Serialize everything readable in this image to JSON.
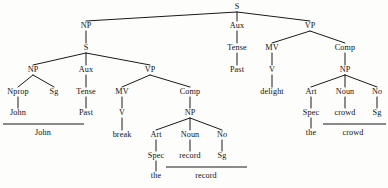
{
  "diagram": {
    "sentence": "John Past break the record Past delight the crowd",
    "width": 388,
    "height": 188,
    "background_color": "#fdfdfc",
    "ink_color": "#1a1a1a"
  },
  "nodes": [
    {
      "id": "s-root",
      "label": "S",
      "kind": "cat",
      "x": 237,
      "y": 7
    },
    {
      "id": "np-subj",
      "label": "NP",
      "kind": "cat",
      "x": 86,
      "y": 26
    },
    {
      "id": "aux-main",
      "label": "Aux",
      "kind": "cat",
      "x": 237,
      "y": 26
    },
    {
      "id": "vp-main",
      "label": "VP",
      "kind": "cat",
      "x": 310,
      "y": 26
    },
    {
      "id": "s-embedded",
      "label": "S",
      "kind": "cat",
      "x": 86,
      "y": 48
    },
    {
      "id": "tense-main",
      "label": "Tense",
      "kind": "cat",
      "x": 237,
      "y": 48
    },
    {
      "id": "mv-main",
      "label": "MV",
      "kind": "cat",
      "x": 272,
      "y": 48
    },
    {
      "id": "comp-main",
      "label": "Comp",
      "kind": "cat",
      "x": 345,
      "y": 48
    },
    {
      "id": "np-emb",
      "label": "NP",
      "kind": "cat",
      "x": 33,
      "y": 70
    },
    {
      "id": "aux-emb",
      "label": "Aux",
      "kind": "cat",
      "x": 86,
      "y": 70
    },
    {
      "id": "vp-emb",
      "label": "VP",
      "kind": "cat",
      "x": 150,
      "y": 70
    },
    {
      "id": "past-main",
      "label": "Past",
      "kind": "terminal",
      "x": 237,
      "y": 70
    },
    {
      "id": "v-main",
      "label": "V",
      "kind": "cat",
      "x": 272,
      "y": 70
    },
    {
      "id": "np-obj-main",
      "label": "NP",
      "kind": "cat",
      "x": 345,
      "y": 70
    },
    {
      "id": "nprop",
      "label": "Nprop",
      "kind": "cat",
      "x": 18,
      "y": 92
    },
    {
      "id": "sg-subj",
      "label": "Sg",
      "kind": "cat",
      "x": 54,
      "y": 92
    },
    {
      "id": "tense-emb",
      "label": "Tense",
      "kind": "cat",
      "x": 86,
      "y": 92
    },
    {
      "id": "mv-emb",
      "label": "MV",
      "kind": "cat",
      "x": 122,
      "y": 92
    },
    {
      "id": "comp-emb",
      "label": "Comp",
      "kind": "cat",
      "x": 190,
      "y": 92
    },
    {
      "id": "delight",
      "label": "delight",
      "kind": "terminal",
      "x": 272,
      "y": 92
    },
    {
      "id": "art-main",
      "label": "Art",
      "kind": "cat",
      "x": 311,
      "y": 92
    },
    {
      "id": "noun-main",
      "label": "Noun",
      "kind": "cat",
      "x": 345,
      "y": 92
    },
    {
      "id": "no-main",
      "label": "No",
      "kind": "cat",
      "x": 377,
      "y": 92,
      "italic_tail": 1
    },
    {
      "id": "john-term",
      "label": "John",
      "kind": "terminal",
      "x": 18,
      "y": 113
    },
    {
      "id": "past-emb",
      "label": "Past",
      "kind": "terminal",
      "x": 86,
      "y": 113
    },
    {
      "id": "v-emb",
      "label": "V",
      "kind": "cat",
      "x": 122,
      "y": 113
    },
    {
      "id": "np-obj-emb",
      "label": "NP",
      "kind": "cat",
      "x": 190,
      "y": 113
    },
    {
      "id": "spec-main",
      "label": "Spec",
      "kind": "cat",
      "x": 311,
      "y": 113
    },
    {
      "id": "crowd-term",
      "label": "crowd",
      "kind": "terminal",
      "x": 345,
      "y": 113
    },
    {
      "id": "sg-main",
      "label": "Sg",
      "kind": "cat",
      "x": 377,
      "y": 113
    },
    {
      "id": "break-term",
      "label": "break",
      "kind": "terminal",
      "x": 122,
      "y": 135
    },
    {
      "id": "art-emb",
      "label": "Art",
      "kind": "cat",
      "x": 156,
      "y": 135
    },
    {
      "id": "noun-emb",
      "label": "Noun",
      "kind": "cat",
      "x": 190,
      "y": 135
    },
    {
      "id": "no-emb",
      "label": "No",
      "kind": "cat",
      "x": 222,
      "y": 135,
      "italic_tail": 1
    },
    {
      "id": "the-main",
      "label": "the",
      "kind": "terminal",
      "x": 311,
      "y": 133
    },
    {
      "id": "spec-emb",
      "label": "Spec",
      "kind": "cat",
      "x": 156,
      "y": 156
    },
    {
      "id": "record-term",
      "label": "record",
      "kind": "terminal",
      "x": 190,
      "y": 156
    },
    {
      "id": "sg-emb",
      "label": "Sg",
      "kind": "cat",
      "x": 222,
      "y": 156
    },
    {
      "id": "the-emb",
      "label": "the",
      "kind": "terminal",
      "x": 156,
      "y": 176
    },
    {
      "id": "phrase-john",
      "label": "John",
      "kind": "phrase",
      "x": 43,
      "y": 133
    },
    {
      "id": "phrase-crowd",
      "label": "crowd",
      "kind": "phrase",
      "x": 353,
      "y": 133
    },
    {
      "id": "phrase-record",
      "label": "record",
      "kind": "phrase",
      "x": 206,
      "y": 176
    }
  ],
  "edges": [
    {
      "from": "s-root",
      "to": "np-subj"
    },
    {
      "from": "s-root",
      "to": "aux-main"
    },
    {
      "from": "s-root",
      "to": "vp-main"
    },
    {
      "from": "np-subj",
      "to": "s-embedded"
    },
    {
      "from": "aux-main",
      "to": "tense-main"
    },
    {
      "from": "vp-main",
      "to": "mv-main"
    },
    {
      "from": "vp-main",
      "to": "comp-main"
    },
    {
      "from": "s-embedded",
      "to": "np-emb"
    },
    {
      "from": "s-embedded",
      "to": "aux-emb"
    },
    {
      "from": "s-embedded",
      "to": "vp-emb"
    },
    {
      "from": "tense-main",
      "to": "past-main"
    },
    {
      "from": "mv-main",
      "to": "v-main"
    },
    {
      "from": "comp-main",
      "to": "np-obj-main"
    },
    {
      "from": "np-emb",
      "to": "nprop"
    },
    {
      "from": "np-emb",
      "to": "sg-subj"
    },
    {
      "from": "aux-emb",
      "to": "tense-emb"
    },
    {
      "from": "vp-emb",
      "to": "mv-emb"
    },
    {
      "from": "vp-emb",
      "to": "comp-emb"
    },
    {
      "from": "v-main",
      "to": "delight"
    },
    {
      "from": "np-obj-main",
      "to": "art-main"
    },
    {
      "from": "np-obj-main",
      "to": "noun-main"
    },
    {
      "from": "np-obj-main",
      "to": "no-main"
    },
    {
      "from": "nprop",
      "to": "john-term"
    },
    {
      "from": "tense-emb",
      "to": "past-emb"
    },
    {
      "from": "mv-emb",
      "to": "v-emb"
    },
    {
      "from": "comp-emb",
      "to": "np-obj-emb"
    },
    {
      "from": "art-main",
      "to": "spec-main"
    },
    {
      "from": "noun-main",
      "to": "crowd-term"
    },
    {
      "from": "no-main",
      "to": "sg-main"
    },
    {
      "from": "v-emb",
      "to": "break-term"
    },
    {
      "from": "np-obj-emb",
      "to": "art-emb"
    },
    {
      "from": "np-obj-emb",
      "to": "noun-emb"
    },
    {
      "from": "np-obj-emb",
      "to": "no-emb"
    },
    {
      "from": "spec-main",
      "to": "the-main"
    },
    {
      "from": "art-emb",
      "to": "spec-emb"
    },
    {
      "from": "noun-emb",
      "to": "record-term"
    },
    {
      "from": "no-emb",
      "to": "sg-emb"
    },
    {
      "from": "spec-emb",
      "to": "the-emb"
    }
  ],
  "underlines": [
    {
      "id": "underline-john",
      "x1": 3,
      "x2": 84,
      "y": 124
    },
    {
      "id": "underline-crowd",
      "x1": 323,
      "x2": 386,
      "y": 124
    },
    {
      "id": "underline-record",
      "x1": 166,
      "x2": 247,
      "y": 167
    }
  ]
}
